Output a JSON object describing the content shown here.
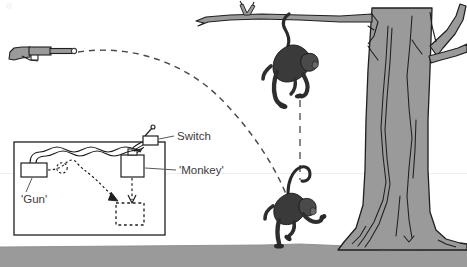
{
  "figure": {
    "background_color": "#ffffff"
  },
  "palette": {
    "tree_fill": "#9a9a9a",
    "tree_stroke": "#1f1f1f",
    "ground_fill": "#9a9a9a",
    "monkey_fill": "#3a3a3a",
    "monkey_stroke": "#151515",
    "gun_fill": "#9a9a9a",
    "gun_stroke": "#1f1f1f",
    "trajectory_stroke": "#4a4a4a",
    "inset_stroke": "#1f1f1f",
    "label_color": "#3b3b3b",
    "dashed_fall_stroke": "#5a5a5a"
  },
  "labels": {
    "switch": "Switch",
    "monkey": "'Monkey'",
    "gun": "'Gun'"
  },
  "scene": {
    "ground": {
      "y": 236,
      "height": 31
    },
    "tree": {
      "trunk_left": 366,
      "trunk_right": 430
    },
    "branch": {
      "attach_x": 290,
      "attach_y": 19
    },
    "hanging_monkey": {
      "x": 292,
      "y": 60
    },
    "falling_monkey": {
      "x": 292,
      "y": 205
    },
    "gun_muzzle": {
      "x": 74,
      "y": 53
    }
  },
  "inset": {
    "box": {
      "x": 14,
      "y": 142,
      "width": 151,
      "height": 93
    },
    "gun_box_label": "'Gun'",
    "switch_label": "Switch",
    "monkey_box_label": "'Monkey'"
  }
}
